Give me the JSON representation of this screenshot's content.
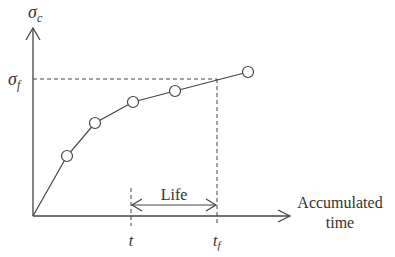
{
  "diagram": {
    "y_axis_label": {
      "main": "σ",
      "sub": "c"
    },
    "fail_level_label": {
      "main": "σ",
      "sub": "f"
    },
    "x_axis_label_line1": "Accumulated",
    "x_axis_label_line2": "time",
    "t_label": "t",
    "tf_label": {
      "main": "t",
      "sub": "f"
    },
    "life_label": "Life",
    "points": [
      {
        "x": 67,
        "y": 156
      },
      {
        "x": 95,
        "y": 123
      },
      {
        "x": 133,
        "y": 102
      },
      {
        "x": 175,
        "y": 91
      },
      {
        "x": 248,
        "y": 72
      }
    ],
    "line_color": "#333333"
  }
}
